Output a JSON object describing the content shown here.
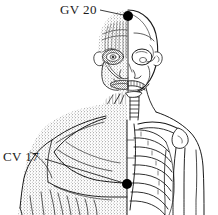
{
  "figure": {
    "kind": "anatomical-line-drawing",
    "split": "midline split: left half superficial musculature (stippled), right half skeleton",
    "background_color": "#ffffff",
    "ink_color": "#1a1a1a",
    "width": 218,
    "height": 215,
    "cropped_edge": "bottom"
  },
  "acupoints": [
    {
      "id": "gv20",
      "label": "GV 20",
      "label_x": 60,
      "label_y": 2,
      "marker_x": 128,
      "marker_y": 16,
      "marker_radius": 5,
      "marker_color": "#000000",
      "leader_from_x": 100,
      "leader_from_y": 10,
      "location": "vertex of the head (crown)"
    },
    {
      "id": "cv17",
      "label": "CV 17",
      "label_x": 3,
      "label_y": 149,
      "marker_x": 127,
      "marker_y": 184,
      "marker_radius": 5,
      "marker_color": "#000000",
      "leader_from_x": 45,
      "leader_from_y": 159,
      "location": "midsternum, level of fourth intercostal space"
    }
  ],
  "anatomy_regions": [
    {
      "name": "cranium",
      "side": "right",
      "rendering": "bone outline"
    },
    {
      "name": "facial-muscles",
      "side": "left",
      "rendering": "stipple"
    },
    {
      "name": "orbit",
      "side": "right",
      "rendering": "bone outline"
    },
    {
      "name": "orbicularis-oculi",
      "side": "left",
      "rendering": "stipple"
    },
    {
      "name": "mandible-teeth",
      "side": "right",
      "rendering": "bone outline"
    },
    {
      "name": "cervical-vertebrae",
      "side": "right",
      "rendering": "bone outline"
    },
    {
      "name": "sternocleidomastoid",
      "side": "left",
      "rendering": "stipple"
    },
    {
      "name": "clavicle",
      "side": "right",
      "rendering": "bone outline"
    },
    {
      "name": "ribcage",
      "side": "right",
      "rendering": "bone outline",
      "visible_ribs": 9
    },
    {
      "name": "sternum",
      "side": "midline",
      "rendering": "bone outline"
    },
    {
      "name": "scapula-humerus",
      "side": "right",
      "rendering": "bone outline"
    },
    {
      "name": "deltoid",
      "side": "left",
      "rendering": "stipple"
    },
    {
      "name": "pectoralis-major",
      "side": "left",
      "rendering": "stipple"
    },
    {
      "name": "biceps-brachii",
      "side": "left",
      "rendering": "stipple"
    },
    {
      "name": "rectus-abdominis",
      "side": "left",
      "rendering": "stipple"
    }
  ]
}
